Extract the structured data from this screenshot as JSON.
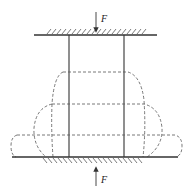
{
  "diagram": {
    "force_top": {
      "label": "F",
      "direction": "down"
    },
    "force_bottom": {
      "label": "F",
      "direction": "up"
    },
    "line_color": "#333333",
    "dash_color": "#555555",
    "stages": [
      "original",
      "stage-1-barrel",
      "stage-2-barrel",
      "stage-3-flattened"
    ]
  }
}
